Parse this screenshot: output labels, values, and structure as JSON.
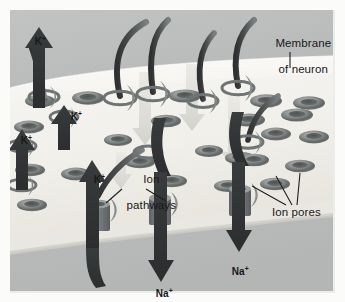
{
  "figure": {
    "kind": "biology-illustration",
    "canvas": {
      "width": 345,
      "height": 302
    },
    "colors": {
      "page_background": "#fbfbfa",
      "outer_frame": "#e8e8e6",
      "extracellular_gray": "#b9bbba",
      "membrane_face": "#f4f3f0",
      "membrane_rim": "#e2e0da",
      "intracellular_gray": "#bcbebd",
      "pore_dark": "#5d6060",
      "pore_light": "#9fa3a1",
      "arrow_dark": "#303233",
      "arrow_pale": "#dcdcd8",
      "channel_body": "#74787a",
      "text": "#18181a",
      "leader_line": "#1e1f20"
    }
  },
  "labels": {
    "membrane": {
      "line1": "Membrane",
      "line2": "of neuron"
    },
    "ion_pathways": {
      "line1": "Ion",
      "line2": "pathways"
    },
    "ion_pores": "Ion pores",
    "potassium": "K",
    "sodium": "Na",
    "charge": "+"
  },
  "callouts": [
    {
      "name": "membrane-of-neuron",
      "text": "Membrane of neuron",
      "x": 262,
      "y": 24,
      "leaders": 1
    },
    {
      "name": "ion-pathways",
      "text": "Ion pathways",
      "x": 123,
      "y": 160,
      "leaders": 2
    },
    {
      "name": "ion-pores",
      "text": "Ion pores",
      "x": 272,
      "y": 211,
      "leaders": 3
    }
  ],
  "ion_labels": [
    {
      "id": "k-out-1",
      "ion": "K",
      "charge": "+",
      "x": 33,
      "y": 31,
      "direction": "outward"
    },
    {
      "id": "k-out-2",
      "ion": "K",
      "charge": "+",
      "x": 68,
      "y": 107,
      "direction": "outward"
    },
    {
      "id": "k-out-3",
      "ion": "K",
      "charge": "+",
      "x": 19,
      "y": 130,
      "direction": "outward"
    },
    {
      "id": "k-out-4",
      "ion": "K",
      "charge": "+",
      "x": 90,
      "y": 170,
      "direction": "outward"
    },
    {
      "id": "na-in-1",
      "ion": "Na",
      "charge": "+",
      "x": 154,
      "y": 283,
      "direction": "inward"
    },
    {
      "id": "na-in-2",
      "ion": "Na",
      "charge": "+",
      "x": 229,
      "y": 262,
      "direction": "inward"
    }
  ],
  "flows": {
    "outward_arrows": 4,
    "inward_arrows": 2,
    "pale_inward_arrows": 4,
    "curved_tails": 6
  },
  "pores": {
    "count_on_surface": 22,
    "channels_in_membrane": 3
  }
}
